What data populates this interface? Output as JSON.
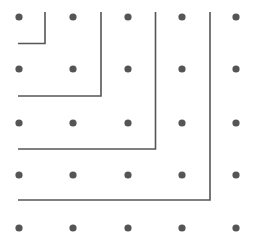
{
  "figure": {
    "width": 254,
    "height": 248,
    "background_color": "#ffffff"
  },
  "grid": {
    "label": "dot lattice",
    "rows": 5,
    "columns": 5,
    "dot_color": "#555555",
    "dot_radius": 3.6,
    "x_positions": [
      19,
      73,
      128,
      182,
      236
    ],
    "y_positions": [
      17,
      69,
      123,
      175,
      228
    ],
    "dots": [
      {
        "id": "dot-r1-c1",
        "x": 19,
        "y": 17
      },
      {
        "id": "dot-r1-c2",
        "x": 73,
        "y": 17
      },
      {
        "id": "dot-r1-c3",
        "x": 128,
        "y": 17
      },
      {
        "id": "dot-r1-c4",
        "x": 182,
        "y": 17
      },
      {
        "id": "dot-r1-c5",
        "x": 236,
        "y": 17
      },
      {
        "id": "dot-r2-c1",
        "x": 19,
        "y": 69
      },
      {
        "id": "dot-r2-c2",
        "x": 73,
        "y": 69
      },
      {
        "id": "dot-r2-c3",
        "x": 128,
        "y": 69
      },
      {
        "id": "dot-r2-c4",
        "x": 182,
        "y": 69
      },
      {
        "id": "dot-r2-c5",
        "x": 236,
        "y": 69
      },
      {
        "id": "dot-r3-c1",
        "x": 19,
        "y": 123
      },
      {
        "id": "dot-r3-c2",
        "x": 73,
        "y": 123
      },
      {
        "id": "dot-r3-c3",
        "x": 128,
        "y": 123
      },
      {
        "id": "dot-r3-c4",
        "x": 182,
        "y": 123
      },
      {
        "id": "dot-r3-c5",
        "x": 236,
        "y": 123
      },
      {
        "id": "dot-r4-c1",
        "x": 19,
        "y": 175
      },
      {
        "id": "dot-r4-c2",
        "x": 73,
        "y": 175
      },
      {
        "id": "dot-r4-c3",
        "x": 128,
        "y": 175
      },
      {
        "id": "dot-r4-c4",
        "x": 182,
        "y": 175
      },
      {
        "id": "dot-r4-c5",
        "x": 236,
        "y": 175
      },
      {
        "id": "dot-r5-c1",
        "x": 19,
        "y": 228
      },
      {
        "id": "dot-r5-c2",
        "x": 73,
        "y": 228
      },
      {
        "id": "dot-r5-c3",
        "x": 128,
        "y": 228
      },
      {
        "id": "dot-r5-c4",
        "x": 182,
        "y": 228
      },
      {
        "id": "dot-r5-c5",
        "x": 236,
        "y": 228
      }
    ]
  },
  "paths": {
    "label": "nested L-shaped polylines",
    "stroke_color": "#555555",
    "stroke_width": 1.6,
    "items": [
      {
        "id": "path-l1-innermost",
        "name": "innermost-l-path",
        "d": "M 45 12 L 45 43.5 L 18 43.5",
        "vertical_x": 45,
        "vertical_y_start": 12,
        "vertical_y_end": 43.5,
        "horizontal_y": 43.5,
        "horizontal_x_start": 45,
        "horizontal_x_end": 18
      },
      {
        "id": "path-l2",
        "name": "second-l-path",
        "d": "M 101 12 L 101 96 L 18 96",
        "vertical_x": 101,
        "vertical_y_start": 12,
        "vertical_y_end": 96,
        "horizontal_y": 96,
        "horizontal_x_start": 101,
        "horizontal_x_end": 18
      },
      {
        "id": "path-l3",
        "name": "third-l-path",
        "d": "M 155.5 12 L 155.5 149 L 18 149",
        "vertical_x": 155.5,
        "vertical_y_start": 12,
        "vertical_y_end": 149,
        "horizontal_y": 149,
        "horizontal_x_start": 155.5,
        "horizontal_x_end": 18
      },
      {
        "id": "path-l4-outermost",
        "name": "outermost-l-path",
        "d": "M 210 12 L 210 200 L 18 200",
        "vertical_x": 210,
        "vertical_y_start": 12,
        "vertical_y_end": 200,
        "horizontal_y": 200,
        "horizontal_x_start": 210,
        "horizontal_x_end": 18
      }
    ]
  }
}
